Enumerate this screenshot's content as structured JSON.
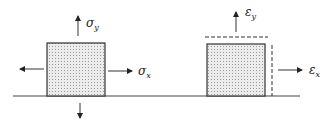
{
  "diagram": {
    "title": "",
    "left_panel": {
      "description": "Stressed element with normal stresses",
      "labels": {
        "sigma_y": "σ",
        "sigma_y_sub": "y",
        "sigma_x": "σ",
        "sigma_x_sub": "x"
      }
    },
    "right_panel": {
      "description": "Strained element with dashed deformed outline",
      "labels": {
        "eps_y": "ε",
        "eps_y_sub": "y",
        "eps_x": "ε",
        "eps_x_sub": "x"
      }
    },
    "colors": {
      "line": "#333333",
      "fill": "#e6e6e6",
      "stipple": "#9a9a9a"
    }
  }
}
